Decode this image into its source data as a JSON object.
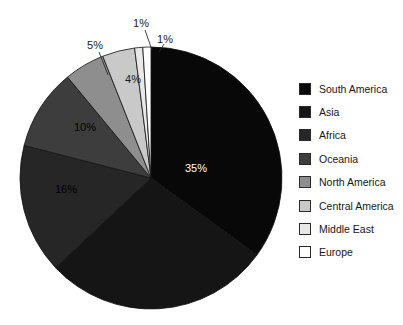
{
  "chart_data": {
    "type": "pie",
    "title": "",
    "subtitle": "",
    "xlabel": "",
    "ylabel": "",
    "legend_position": "right",
    "grid": false,
    "start_angle_deg": 0,
    "direction": "clockwise",
    "categories": [
      "South America",
      "Asia",
      "Africa",
      "Oceania",
      "North America",
      "Central America",
      "Middle East",
      "Europe"
    ],
    "values": [
      35,
      28,
      16,
      10,
      5,
      4,
      1,
      1
    ],
    "value_unit": "%",
    "slices": [
      {
        "label": "South America",
        "value": 35,
        "display": "35%",
        "color": "#080808",
        "label_color": "#ffffff",
        "label_visible": true,
        "label_x": 196,
        "label_y": 169,
        "leader": false
      },
      {
        "label": "Asia",
        "value": 28,
        "display": "28%",
        "color": "#151515",
        "label_color": "#2a2a2a",
        "label_visible": false,
        "label_x": 152,
        "label_y": 252,
        "leader": false
      },
      {
        "label": "Africa",
        "value": 16,
        "display": "16%",
        "color": "#262626",
        "label_color": "#000000",
        "label_visible": true,
        "label_x": 66,
        "label_y": 190,
        "leader": false
      },
      {
        "label": "Oceania",
        "value": 10,
        "display": "10%",
        "color": "#3d3d3d",
        "label_color": "#000000",
        "label_visible": true,
        "label_x": 85,
        "label_y": 128,
        "leader": false
      },
      {
        "label": "North America",
        "value": 5,
        "display": "5%",
        "color": "#8e8e8e",
        "label_color": "#1a1a1a",
        "label_visible": true,
        "label_x": 95,
        "label_y": 46,
        "leader": true,
        "leader_x1": 99,
        "leader_y1": 52,
        "leader_x2": 108,
        "leader_y2": 75
      },
      {
        "label": "Central America",
        "value": 4,
        "display": "4%",
        "color": "#c9c9c9",
        "label_color": "#1a1a1a",
        "label_visible": true,
        "label_x": 133,
        "label_y": 80,
        "leader": false
      },
      {
        "label": "Middle East",
        "value": 1,
        "display": "1%",
        "color": "#e8e8e8",
        "label_color": "#1a1a1a",
        "label_visible": true,
        "label_x": 141,
        "label_y": 24,
        "leader": true,
        "leader_x1": 145,
        "leader_y1": 30,
        "leader_x2": 152,
        "leader_y2": 50
      },
      {
        "label": "Europe",
        "value": 1,
        "display": "1%",
        "color": "#fdfdfd",
        "label_color": "#1a1a1a",
        "label_visible": true,
        "label_x": 165,
        "label_y": 40,
        "leader": true,
        "leader_x1": 164,
        "leader_y1": 44,
        "leader_x2": 159,
        "leader_y2": 52
      }
    ]
  },
  "legend": {
    "items": [
      {
        "label": "South America",
        "color": "#080808"
      },
      {
        "label": "Asia",
        "color": "#151515"
      },
      {
        "label": "Africa",
        "color": "#262626"
      },
      {
        "label": "Oceania",
        "color": "#3d3d3d"
      },
      {
        "label": "North America",
        "color": "#8e8e8e"
      },
      {
        "label": "Central America",
        "color": "#c9c9c9"
      },
      {
        "label": "Middle East",
        "color": "#e8e8e8"
      },
      {
        "label": "Europe",
        "color": "#fdfdfd"
      }
    ]
  },
  "geometry": {
    "center_x": 151,
    "center_y": 178,
    "radius": 131
  }
}
